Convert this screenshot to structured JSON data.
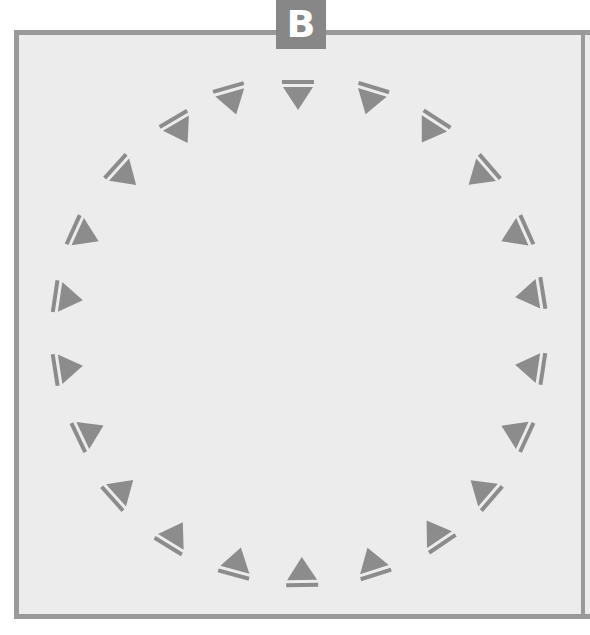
{
  "badge": {
    "label": "B",
    "color": "#878787"
  },
  "frame": {
    "border_color": "#9a9a9a",
    "fill": "#ececec"
  },
  "marker_color": "#8c8c8c",
  "ring_center": [
    299,
    332
  ],
  "markers": [
    {
      "x": 298,
      "y": 95
    },
    {
      "x": 370,
      "y": 100
    },
    {
      "x": 430,
      "y": 130
    },
    {
      "x": 480,
      "y": 175
    },
    {
      "x": 515,
      "y": 235
    },
    {
      "x": 530,
      "y": 295
    },
    {
      "x": 530,
      "y": 367
    },
    {
      "x": 515,
      "y": 432
    },
    {
      "x": 482,
      "y": 490
    },
    {
      "x": 435,
      "y": 533
    },
    {
      "x": 372,
      "y": 562
    },
    {
      "x": 302,
      "y": 572
    },
    {
      "x": 237,
      "y": 562
    },
    {
      "x": 175,
      "y": 535
    },
    {
      "x": 122,
      "y": 490
    },
    {
      "x": 90,
      "y": 432
    },
    {
      "x": 68,
      "y": 368
    },
    {
      "x": 68,
      "y": 298
    },
    {
      "x": 85,
      "y": 235
    },
    {
      "x": 125,
      "y": 175
    },
    {
      "x": 180,
      "y": 130
    },
    {
      "x": 232,
      "y": 100
    }
  ]
}
